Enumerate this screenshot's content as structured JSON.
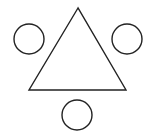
{
  "diagram": {
    "background": "#ffffff",
    "stroke_color": "#222222",
    "stroke_width": 1.4,
    "triangle": {
      "points": "78,8 29,90 126,90"
    },
    "circles": [
      {
        "name": "left",
        "cx": 29,
        "cy": 39,
        "r": 15
      },
      {
        "name": "right",
        "cx": 127,
        "cy": 39,
        "r": 15
      },
      {
        "name": "bottom",
        "cx": 77,
        "cy": 115,
        "r": 15
      }
    ]
  }
}
